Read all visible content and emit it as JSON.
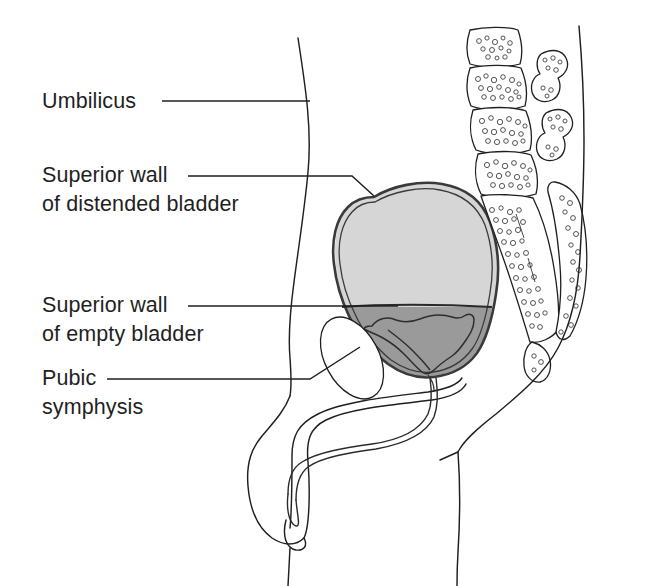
{
  "figure": {
    "background_color": "#ffffff",
    "width": 654,
    "height": 586
  },
  "colors": {
    "ink": "#1f1f1f",
    "bladder_wall": "#3a3a3a",
    "distended_fill": "#d6d6d6",
    "empty_fill": "#9a9a9a",
    "bone_fill": "#ffffff",
    "page": "#ffffff"
  },
  "labels": [
    {
      "id": "umbilicus",
      "lines": [
        "Umbilicus"
      ],
      "x": 42,
      "y": 108,
      "leader": "M 162 101 L 310 101"
    },
    {
      "id": "superior-wall-distended",
      "lines": [
        "Superior wall",
        "of distended bladder"
      ],
      "x": 42,
      "y": 182,
      "leader": "M 188 176 L 352 176 L 374 196"
    },
    {
      "id": "superior-wall-empty",
      "lines": [
        "Superior wall",
        "of empty bladder"
      ],
      "x": 42,
      "y": 312,
      "leader": "M 188 306 L 398 306"
    },
    {
      "id": "pubic-symphysis",
      "lines": [
        "Pubic",
        "symphysis"
      ],
      "x": 42,
      "y": 385,
      "leader": "M 107 379 L 310 379 L 360 347"
    }
  ],
  "anatomy": {
    "abdominal_wall": "anterior body contour",
    "bladder_distended": "superior wall of distended bladder",
    "bladder_empty": "superior wall of empty bladder",
    "pubic_symphysis": "pubic symphysis",
    "urethra": "urethra",
    "penis": "penis outline",
    "vertebrae_count": 4,
    "spinous_process_count": 2,
    "sacrum": "sacrum and coccyx",
    "buttock": "gluteal contour"
  }
}
